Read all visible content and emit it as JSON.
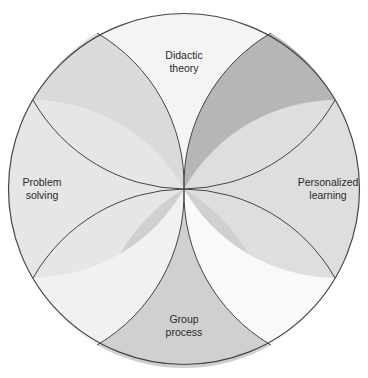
{
  "diagram": {
    "type": "circular-petal-diagram",
    "segments": [
      {
        "id": "didactic",
        "label_line1": "Didactic",
        "label_line2": "theory",
        "color": "#f4f4f4"
      },
      {
        "id": "personalized",
        "label_line1": "Personalized",
        "label_line2": "learning",
        "color": "#dedede"
      },
      {
        "id": "group",
        "label_line1": "Group",
        "label_line2": "process",
        "color": "#d0d0d0"
      },
      {
        "id": "problem",
        "label_line1": "Problem",
        "label_line2": "solving",
        "color": "#e6e6e6"
      }
    ],
    "overlaps": [
      {
        "id": "top-left",
        "color": "#dadada"
      },
      {
        "id": "top-right",
        "color": "#b6b6b6"
      },
      {
        "id": "bottom-left",
        "color": "#f1f1f1"
      },
      {
        "id": "bottom-right",
        "color": "#f9f9f9"
      }
    ],
    "stroke_color": "#444444"
  }
}
